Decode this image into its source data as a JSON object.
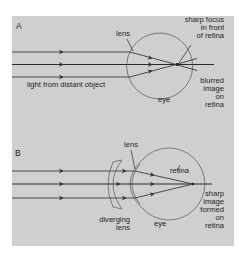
{
  "diagram": {
    "background_color": "#cfcfcf",
    "line_color": "#3a3a3a",
    "eye_outline_color": "#707070",
    "panel_a": {
      "letter": "A",
      "labels": {
        "lens": "lens",
        "focus_line1": "sharp focus",
        "focus_line2": "in front",
        "focus_line3": "of retina",
        "source": "light from distant object",
        "eye": "eye",
        "blur_line1": "blurred",
        "blur_line2": "image",
        "blur_line3": "on",
        "blur_line4": "retina"
      },
      "rays": 3,
      "focus_point": "in front of retina"
    },
    "panel_b": {
      "letter": "B",
      "labels": {
        "lens": "lens",
        "retina": "retina",
        "diverging_line1": "diverging",
        "diverging_line2": "lens",
        "eye": "eye",
        "sharp_line1": "sharp",
        "sharp_line2": "image",
        "sharp_line3": "formed",
        "sharp_line4": "on",
        "sharp_line5": "retina"
      },
      "rays": 3,
      "focus_point": "on retina"
    }
  }
}
